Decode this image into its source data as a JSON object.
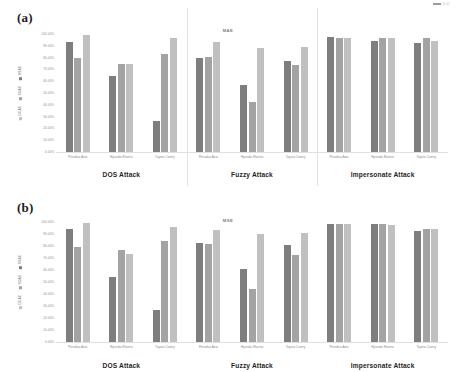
{
  "corner_mark": {
    "text": "9:41"
  },
  "chart_data": [
    {
      "type": "bar",
      "panel_tag": "(a)",
      "title": "MAE",
      "xlabel": "",
      "ylabel": "",
      "ylim": [
        0,
        100
      ],
      "grid": false,
      "legend_position": "left-vertical",
      "ytick_labels": [
        "100.00%",
        "90.00%",
        "80.00%",
        "70.00%",
        "60.00%",
        "50.00%",
        "40.00%",
        "30.00%",
        "20.00%",
        "10.00%",
        "0.00%"
      ],
      "legend": [
        "SSAE",
        "SDAE",
        "DCAE"
      ],
      "groups": [
        "DOS Attack",
        "Fuzzy Attack",
        "Impersonate Attack"
      ],
      "categories": [
        "Perodua Axia",
        "Hyundai Elantra",
        "Toyota Camry"
      ],
      "series": [
        {
          "name": "SSAE",
          "color": "#7e7e7e",
          "values": [
            [
              93.0,
              64.0,
              26.0
            ],
            [
              80.0,
              57.0,
              77.0
            ],
            [
              97.5,
              94.5,
              92.5
            ]
          ]
        },
        {
          "name": "SDAE",
          "color": "#a3a3a3",
          "values": [
            [
              80.0,
              75.0,
              83.0
            ],
            [
              80.5,
              42.5,
              74.0
            ],
            [
              96.5,
              97.0,
              96.5
            ]
          ]
        },
        {
          "name": "DCAE",
          "color": "#c0c0c0",
          "values": [
            [
              99.5,
              75.0,
              96.5
            ],
            [
              93.5,
              88.0,
              89.0
            ],
            [
              97.0,
              97.0,
              94.5
            ]
          ]
        }
      ]
    },
    {
      "type": "bar",
      "panel_tag": "(b)",
      "title": "MSE",
      "xlabel": "",
      "ylabel": "",
      "ylim": [
        0,
        100
      ],
      "grid": false,
      "legend_position": "left-vertical",
      "ytick_labels": [
        "100.00%",
        "90.00%",
        "80.00%",
        "70.00%",
        "60.00%",
        "50.00%",
        "40.00%",
        "30.00%",
        "20.00%",
        "10.00%",
        "0.00%"
      ],
      "legend": [
        "SSAE",
        "SDAE",
        "DCAE"
      ],
      "groups": [
        "DOS Attack",
        "Fuzzy Attack",
        "Impersonate Attack"
      ],
      "categories": [
        "Perodua Axia",
        "Hyundai Elantra",
        "Toyota Camry"
      ],
      "series": [
        {
          "name": "SSAE",
          "color": "#7e7e7e",
          "values": [
            [
              94.5,
              54.5,
              26.5
            ],
            [
              82.5,
              61.0,
              80.5
            ],
            [
              98.5,
              98.0,
              92.5
            ]
          ]
        },
        {
          "name": "SDAE",
          "color": "#a3a3a3",
          "values": [
            [
              79.5,
              76.5,
              84.5
            ],
            [
              82.0,
              44.5,
              72.5
            ],
            [
              98.0,
              98.0,
              94.5
            ]
          ]
        },
        {
          "name": "DCAE",
          "color": "#c0c0c0",
          "values": [
            [
              99.5,
              73.0,
              95.5
            ],
            [
              93.5,
              90.0,
              91.0
            ],
            [
              98.0,
              97.5,
              94.0
            ]
          ]
        }
      ]
    }
  ]
}
